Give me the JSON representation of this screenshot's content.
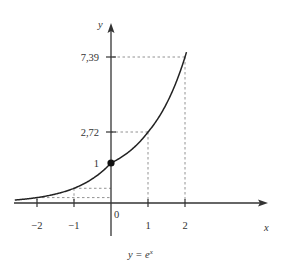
{
  "chart_data": {
    "type": "line",
    "caption": "y = eˣ",
    "xlabel": "x",
    "ylabel": "y",
    "function": "exp",
    "x_range": [
      -2.6,
      2.05
    ],
    "x_ticks": [
      {
        "value": -2,
        "label": "−2"
      },
      {
        "value": -1,
        "label": "−1"
      },
      {
        "value": 1,
        "label": "1"
      },
      {
        "value": 2,
        "label": "2"
      }
    ],
    "origin_label": "0",
    "y_ticks": [
      {
        "value": 1,
        "label": "1"
      },
      {
        "value": 2.72,
        "label": "2,72"
      },
      {
        "value": 7.39,
        "label": "7,39"
      }
    ],
    "highlighted_points": [
      {
        "x": -2,
        "y": 0.14
      },
      {
        "x": -1,
        "y": 0.37
      },
      {
        "x": 0,
        "y": 1,
        "marker": "filled-dot"
      },
      {
        "x": 1,
        "y": 2.72
      },
      {
        "x": 2,
        "y": 7.39
      }
    ],
    "points": [
      {
        "x": -2,
        "y": 0.135
      },
      {
        "x": -1,
        "y": 0.368
      },
      {
        "x": 0,
        "y": 1
      },
      {
        "x": 1,
        "y": 2.718
      },
      {
        "x": 2,
        "y": 7.389
      }
    ],
    "grid": false,
    "guide_lines": "dashed"
  },
  "labels": {
    "y_axis": "y",
    "x_axis": "x",
    "caption_lhs": "y = e",
    "caption_exp": "x"
  }
}
